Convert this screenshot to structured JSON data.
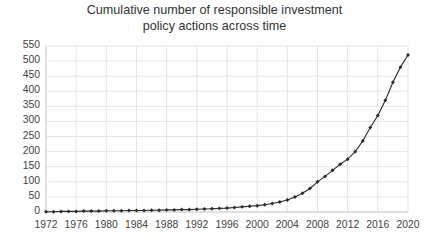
{
  "chart_data": {
    "type": "line",
    "title": "Cumulative number of responsible investment\npolicy actions across time",
    "title_line1": "Cumulative number of responsible investment",
    "title_line2": "policy actions across time",
    "xlabel": "",
    "ylabel": "",
    "xlim": [
      1972,
      2020
    ],
    "ylim": [
      0,
      550
    ],
    "ytick_step": 50,
    "xtick_step": 4,
    "grid": true,
    "legend": false,
    "legend_position": "none",
    "marker": "diamond",
    "line_color": "#2b2b2b",
    "grid_color": "#e4e4e4",
    "text_color": "#444444",
    "background": "#ffffff",
    "yticks": [
      0,
      50,
      100,
      150,
      200,
      250,
      300,
      350,
      400,
      450,
      500,
      550
    ],
    "xticks": [
      1972,
      1976,
      1980,
      1984,
      1988,
      1992,
      1996,
      2000,
      2004,
      2008,
      2012,
      2016,
      2020
    ],
    "x": [
      1972,
      1973,
      1974,
      1975,
      1976,
      1977,
      1978,
      1979,
      1980,
      1981,
      1982,
      1983,
      1984,
      1985,
      1986,
      1987,
      1988,
      1989,
      1990,
      1991,
      1992,
      1993,
      1994,
      1995,
      1996,
      1997,
      1998,
      1999,
      2000,
      2001,
      2002,
      2003,
      2004,
      2005,
      2006,
      2007,
      2008,
      2009,
      2010,
      2011,
      2012,
      2013,
      2014,
      2015,
      2016,
      2017,
      2018,
      2019,
      2020
    ],
    "values": [
      1,
      1,
      2,
      2,
      2,
      3,
      3,
      3,
      4,
      4,
      4,
      5,
      5,
      5,
      6,
      6,
      7,
      7,
      8,
      8,
      9,
      10,
      11,
      12,
      13,
      15,
      17,
      19,
      21,
      24,
      28,
      33,
      40,
      50,
      62,
      78,
      100,
      118,
      138,
      158,
      175,
      200,
      235,
      280,
      320,
      370,
      430,
      480,
      520
    ],
    "series": [
      {
        "name": "Cumulative policy actions",
        "values": [
          1,
          1,
          2,
          2,
          2,
          3,
          3,
          3,
          4,
          4,
          4,
          5,
          5,
          5,
          6,
          6,
          7,
          7,
          8,
          8,
          9,
          10,
          11,
          12,
          13,
          15,
          17,
          19,
          21,
          24,
          28,
          33,
          40,
          50,
          62,
          78,
          100,
          118,
          138,
          158,
          175,
          200,
          235,
          280,
          320,
          370,
          430,
          480,
          520
        ]
      }
    ]
  }
}
